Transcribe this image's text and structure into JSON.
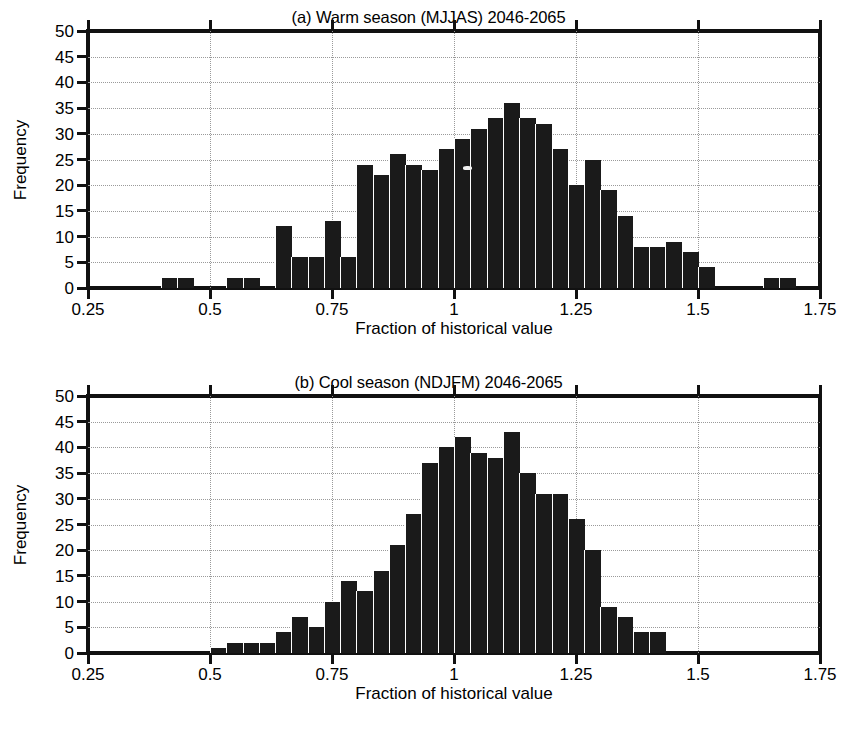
{
  "figure": {
    "background": "#ffffff",
    "ink_color": "#1a1a1a",
    "grid_color": "#9a9a9a"
  },
  "panels": [
    {
      "id": "panel-a",
      "title": "(a) Warm season (MJJAS) 2046-2065",
      "xlabel": "Fraction of historical value",
      "ylabel": "Frequency"
    },
    {
      "id": "panel-b",
      "title": "(b) Cool season (NDJFM) 2046-2065",
      "xlabel": "Fraction of historical value",
      "ylabel": "Frequency"
    }
  ],
  "axes": {
    "y_ticks": [
      0,
      5,
      10,
      15,
      20,
      25,
      30,
      35,
      40,
      45,
      50
    ],
    "y_tick_labels": [
      "0",
      "5",
      "10",
      "15",
      "20",
      "25",
      "30",
      "35",
      "40",
      "45",
      "50"
    ],
    "x_ticks": [
      0.25,
      0.5,
      0.75,
      1,
      1.25,
      1.5,
      1.75
    ],
    "x_tick_labels": [
      "0.25",
      "0.5",
      "0.75",
      "1",
      "1.25",
      "1.5",
      "1.75"
    ],
    "ylim": [
      0,
      50
    ],
    "xlim": [
      0.25,
      1.75
    ],
    "grid": true
  },
  "chart_data": [
    {
      "type": "bar",
      "title": "(a) Warm season (MJJAS) 2046-2065",
      "xlabel": "Fraction of historical value",
      "ylabel": "Frequency",
      "xlim": [
        0.25,
        1.75
      ],
      "ylim": [
        0,
        50
      ],
      "grid": true,
      "legend": null,
      "bin_width": 0.0333,
      "bin_left_edges": [
        0.4,
        0.433,
        0.467,
        0.533,
        0.567,
        0.633,
        0.667,
        0.7,
        0.733,
        0.767,
        0.8,
        0.833,
        0.867,
        0.9,
        0.933,
        0.967,
        1.0,
        1.033,
        1.067,
        1.1,
        1.133,
        1.167,
        1.2,
        1.233,
        1.267,
        1.3,
        1.333,
        1.367,
        1.4,
        1.433,
        1.467,
        1.5,
        1.633,
        1.667
      ],
      "values": [
        2,
        2,
        0,
        2,
        2,
        12,
        6,
        6,
        13,
        6,
        24,
        22,
        26,
        24,
        23,
        27,
        29,
        31,
        33,
        36,
        33,
        32,
        27,
        20,
        25,
        19,
        14,
        8,
        8,
        9,
        7,
        4,
        2,
        2
      ]
    },
    {
      "type": "bar",
      "title": "(b) Cool season (NDJFM) 2046-2065",
      "xlabel": "Fraction of historical value",
      "ylabel": "Frequency",
      "xlim": [
        0.25,
        1.75
      ],
      "ylim": [
        0,
        50
      ],
      "grid": true,
      "legend": null,
      "bin_width": 0.0333,
      "bin_left_edges": [
        0.5,
        0.533,
        0.567,
        0.6,
        0.633,
        0.667,
        0.7,
        0.733,
        0.767,
        0.8,
        0.833,
        0.867,
        0.9,
        0.933,
        0.967,
        1.0,
        1.033,
        1.067,
        1.1,
        1.133,
        1.167,
        1.2,
        1.233,
        1.267,
        1.3,
        1.333,
        1.367,
        1.4
      ],
      "values": [
        1,
        2,
        2,
        2,
        4,
        7,
        5,
        10,
        14,
        12,
        16,
        21,
        27,
        37,
        40,
        42,
        39,
        38,
        43,
        35,
        31,
        31,
        26,
        20,
        9,
        7,
        4,
        4
      ]
    }
  ]
}
